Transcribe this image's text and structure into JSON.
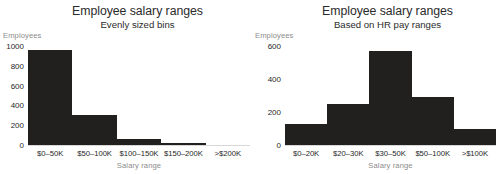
{
  "chart_data": [
    {
      "type": "bar",
      "panel": "left",
      "title": "Employee salary ranges",
      "subtitle": "Evenly sized bins",
      "xlabel": "Salary range",
      "ylabel": "Employees",
      "categories": [
        "$0–50K",
        "$50–100K",
        "$100–150K",
        "$150–200K",
        ">$200K"
      ],
      "values": [
        960,
        300,
        62,
        20,
        5
      ],
      "yticks": [
        0,
        200,
        400,
        600,
        800,
        1000
      ],
      "ytick_labels": [
        "0",
        "200",
        "400",
        "600",
        "800",
        "1000"
      ],
      "ylim": [
        0,
        1000
      ],
      "grid": false,
      "legend": "none",
      "bar_color": "#221f1f",
      "axis_color": "#d8d8d8"
    },
    {
      "type": "bar",
      "panel": "right",
      "title": "Employee salary ranges",
      "subtitle": "Based on HR pay ranges",
      "xlabel": "Salary range",
      "ylabel": "Employees",
      "categories": [
        "$0–20K",
        "$20–30K",
        "$30–50K",
        "$50–100K",
        ">$100K"
      ],
      "values": [
        130,
        250,
        570,
        290,
        100
      ],
      "yticks": [
        0,
        200,
        400,
        600
      ],
      "ytick_labels": [
        "0",
        "200",
        "400",
        "600"
      ],
      "ylim": [
        0,
        600
      ],
      "grid": false,
      "legend": "none",
      "bar_color": "#221f1f",
      "axis_color": "#d8d8d8"
    }
  ]
}
